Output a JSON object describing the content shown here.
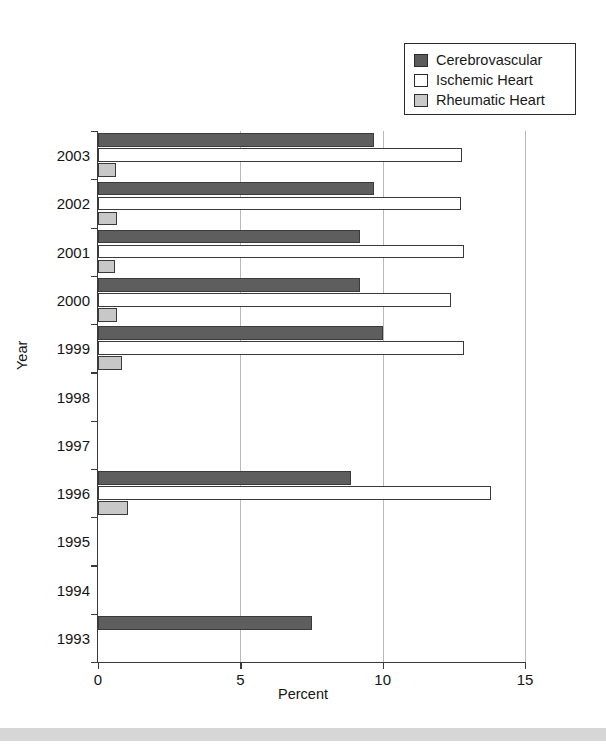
{
  "legend": {
    "items": [
      {
        "label": "Cerebrovascular",
        "icon": "filled-dark-square-swatch",
        "color": "#5b5b5b"
      },
      {
        "label": "Ischemic Heart",
        "icon": "empty-white-square-swatch",
        "color": "#ffffff"
      },
      {
        "label": "Rheumatic Heart",
        "icon": "filled-light-square-swatch",
        "color": "#c9c9c9"
      }
    ]
  },
  "axes": {
    "x_title": "Percent",
    "y_title": "Year",
    "x_ticks": [
      "0",
      "5",
      "10",
      "15"
    ],
    "y_ticks": [
      "2003",
      "2002",
      "2001",
      "2000",
      "1999",
      "1998",
      "1997",
      "1996",
      "1995",
      "1994",
      "1993"
    ]
  },
  "chart_data": {
    "type": "bar",
    "orientation": "horizontal",
    "title": "",
    "xlabel": "Percent",
    "ylabel": "Year",
    "xlim": [
      0,
      15
    ],
    "grid": true,
    "legend_position": "top-right",
    "categories": [
      "2003",
      "2002",
      "2001",
      "2000",
      "1999",
      "1998",
      "1997",
      "1996",
      "1995",
      "1994",
      "1993"
    ],
    "series": [
      {
        "name": "Cerebrovascular",
        "color": "#5e5e5e",
        "values": [
          9.7,
          9.7,
          9.2,
          9.2,
          10.0,
          null,
          null,
          8.9,
          null,
          null,
          7.5
        ]
      },
      {
        "name": "Ischemic Heart",
        "color": "#ffffff",
        "values": [
          12.8,
          12.75,
          12.85,
          12.4,
          12.85,
          null,
          null,
          13.8,
          null,
          null,
          null
        ]
      },
      {
        "name": "Rheumatic Heart",
        "color": "#c8c8c8",
        "values": [
          0.62,
          0.65,
          0.6,
          0.68,
          0.85,
          null,
          null,
          1.05,
          null,
          null,
          null
        ]
      }
    ]
  }
}
